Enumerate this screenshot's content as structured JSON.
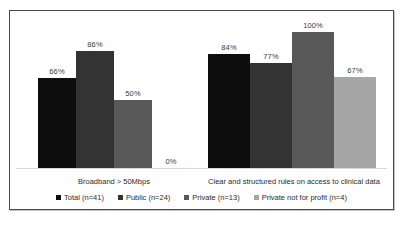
{
  "chart_data": {
    "type": "bar",
    "title": "",
    "subtitle": "",
    "xlabel": "",
    "ylabel": "",
    "ylim": [
      0,
      100
    ],
    "grid": false,
    "legend_position": "bottom",
    "value_label_suffix": "%",
    "categories": [
      "Broadband > 50Mbps",
      "Clear and structured rules on access to clinical data"
    ],
    "series": [
      {
        "name": "Total (n=41)",
        "color": "#0d0d0d",
        "values": [
          66,
          84
        ]
      },
      {
        "name": "Public (n=24)",
        "color": "#333333",
        "values": [
          86,
          77
        ]
      },
      {
        "name": "Private (n=13)",
        "color": "#595959",
        "values": [
          50,
          100
        ]
      },
      {
        "name": "Private not for profit (n=4)",
        "color": "#a6a6a6",
        "values": [
          0,
          67
        ]
      }
    ],
    "groups": [
      {
        "category": "Broadband > 50Mbps",
        "bars": [
          {
            "series": "Total (n=41)",
            "value": 66,
            "label": "66%",
            "color": "#0d0d0d"
          },
          {
            "series": "Public (n=24)",
            "value": 86,
            "label": "86%",
            "color": "#333333"
          },
          {
            "series": "Private (n=13)",
            "value": 50,
            "label": "50%",
            "color": "#595959"
          },
          {
            "series": "Private not for profit (n=4)",
            "value": 0,
            "label": "0%",
            "color": "#a6a6a6"
          }
        ]
      },
      {
        "category": "Clear and structured rules on access to clinical data",
        "bars": [
          {
            "series": "Total (n=41)",
            "value": 84,
            "label": "84%",
            "color": "#0d0d0d"
          },
          {
            "series": "Public (n=24)",
            "value": 77,
            "label": "77%",
            "color": "#333333"
          },
          {
            "series": "Private (n=13)",
            "value": 100,
            "label": "100%",
            "color": "#595959"
          },
          {
            "series": "Private not for profit (n=4)",
            "value": 67,
            "label": "67%",
            "color": "#a6a6a6"
          }
        ]
      }
    ],
    "legend": [
      {
        "label": "Total (n=41)",
        "color": "#0d0d0d",
        "marker": "square-swatch"
      },
      {
        "label": "Public (n=24)",
        "color": "#333333",
        "marker": "square-swatch"
      },
      {
        "label": "Private (n=13)",
        "color": "#595959",
        "marker": "square-swatch"
      },
      {
        "label": "Private not for profit (n=4)",
        "color": "#a6a6a6",
        "marker": "square-swatch"
      }
    ]
  },
  "frame": {
    "border_color": "#4a4a4a",
    "background": "#ffffff",
    "baseline_color": "#d6d6d6"
  }
}
